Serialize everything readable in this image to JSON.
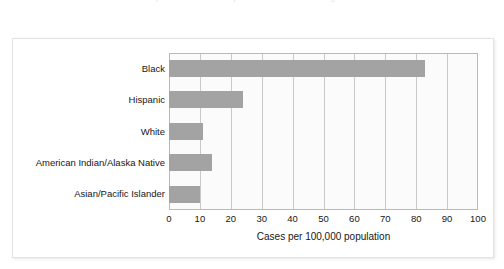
{
  "page": {
    "clipped_top_text": "part of a line of body text cut off above the figure"
  },
  "figure": {
    "background_color": "#ffffff",
    "border_color": "#e3e3e3"
  },
  "chart_data": {
    "type": "bar",
    "orientation": "horizontal",
    "title": "",
    "subtitle": "",
    "xlabel": "Cases per 100,000 population",
    "ylabel": "",
    "categories": [
      "Black",
      "Hispanic",
      "White",
      "American Indian/Alaska Native",
      "Asian/Pacific Islander"
    ],
    "values": [
      83,
      24,
      11,
      14,
      10
    ],
    "xlim": [
      0,
      100
    ],
    "xticks": [
      0,
      10,
      20,
      30,
      40,
      50,
      60,
      70,
      80,
      90,
      100
    ],
    "xtick_labels": [
      "0",
      "10",
      "20",
      "30",
      "40",
      "50",
      "60",
      "70",
      "80",
      "90",
      "100"
    ],
    "grid": "vertical",
    "legend": "none",
    "bar_color": "#a3a3a3",
    "plot_background": "#fbfbfb",
    "plot_border_color": "#b9b9b9",
    "gridline_color": "#c9c9c9"
  }
}
